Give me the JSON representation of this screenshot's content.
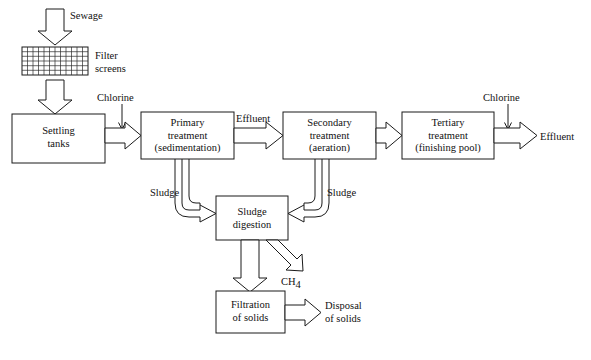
{
  "diagram": {
    "background_color": "#ffffff",
    "line_color": "#1a1a1a",
    "boxes": {
      "settling_tanks": {
        "line1": "Settling",
        "line2": "tanks"
      },
      "primary_treatment": {
        "line1": "Primary",
        "line2": "treatment",
        "line3": "(sedimentation)"
      },
      "secondary_treatment": {
        "line1": "Secondary",
        "line2": "treatment",
        "line3": "(aeration)"
      },
      "tertiary_treatment": {
        "line1": "Tertiary",
        "line2": "treatment",
        "line3": "(finishing pool)"
      },
      "sludge_digestion": {
        "line1": "Sludge",
        "line2": "digestion"
      },
      "filtration_of_solids": {
        "line1": "Filtration",
        "line2": "of solids"
      }
    },
    "labels": {
      "sewage": "Sewage",
      "filter_screens_line1": "Filter",
      "filter_screens_line2": "screens",
      "chlorine_left": "Chlorine",
      "chlorine_right": "Chlorine",
      "effluent_mid": "Effluent",
      "effluent_right": "Effluent",
      "sludge_left": "Sludge",
      "sludge_right": "Sludge",
      "methane_formula": "CH",
      "methane_subscript": "4",
      "disposal_line1": "Disposal",
      "disposal_line2": "of solids"
    },
    "filter_grid": {
      "columns": 12,
      "rows": 6
    }
  }
}
